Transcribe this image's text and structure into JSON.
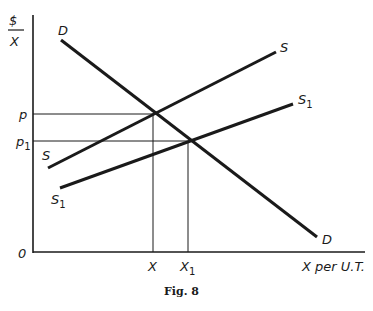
{
  "figure": {
    "caption": "Fig. 8",
    "y_axis_label_top": "$",
    "y_axis_label_bottom": "X",
    "x_axis_label": "X per U.T.",
    "origin_label": "0"
  },
  "price_labels": {
    "p": "p",
    "p1_base": "p",
    "p1_sub": "1"
  },
  "quantity_labels": {
    "x": "X",
    "x1_base": "X",
    "x1_sub": "1"
  },
  "curves": {
    "demand_start_label": "D",
    "demand_end_label": "D",
    "supply_start_label": "S",
    "supply_end_label": "S",
    "supply1_start_base": "S",
    "supply1_start_sub": "1",
    "supply1_end_base": "S",
    "supply1_end_sub": "1"
  },
  "colors": {
    "ink": "#1a1a1a",
    "background": "#ffffff"
  }
}
